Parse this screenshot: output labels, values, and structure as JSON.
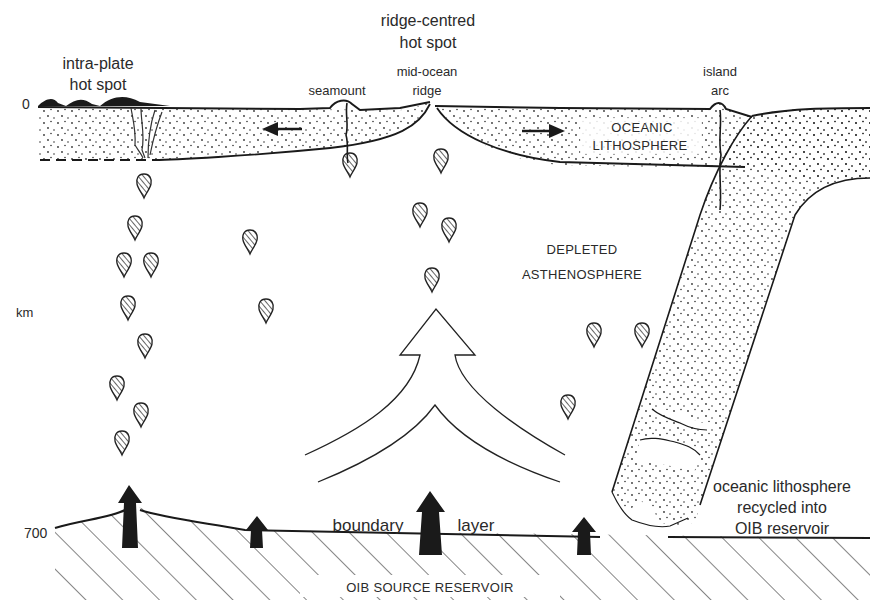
{
  "diagram": {
    "depth_axis": {
      "top_label": "0",
      "unit_label": "km",
      "bottom_label": "700"
    },
    "labels": {
      "intra_plate_line1": "intra-plate",
      "intra_plate_line2": "hot spot",
      "ridge_hotspot_line1": "ridge-centred",
      "ridge_hotspot_line2": "hot spot",
      "mid_ocean_line1": "mid-ocean",
      "mid_ocean_line2": "ridge",
      "seamount": "seamount",
      "island_arc_line1": "island",
      "island_arc_line2": "arc",
      "oceanic_lith_line1": "OCEANIC",
      "oceanic_lith_line2": "LITHOSPHERE",
      "depleted_line1": "DEPLETED",
      "depleted_line2": "ASTHENOSPHERE",
      "boundary": "boundary",
      "layer": "layer",
      "recycled_line1": "oceanic lithosphere",
      "recycled_line2": "recycled into",
      "recycled_line3": "OIB reservoir",
      "source_reservoir": "OIB SOURCE RESERVOIR"
    },
    "colors": {
      "ink": "#1a1a1a",
      "text": "#2a2a2a",
      "background": "#ffffff"
    }
  }
}
